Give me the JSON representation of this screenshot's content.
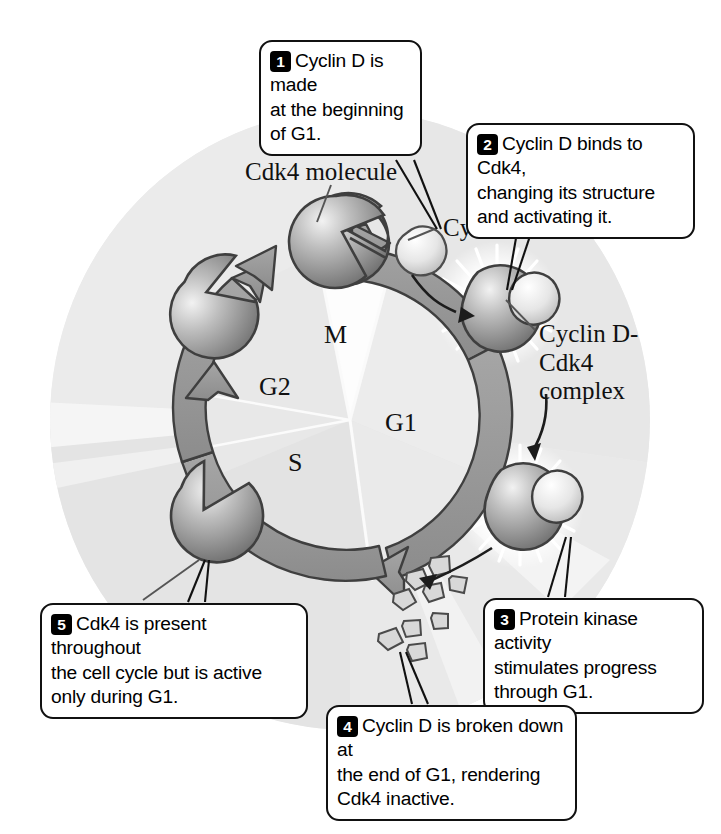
{
  "figure": {
    "title_absent": true,
    "background_color": "#ffffff",
    "cell_fill": "#eeeeee",
    "ring_fill": "#9a9a9a",
    "ring_stroke": "#3c3c3c",
    "protein_dark": "#8d8d8d",
    "protein_light": "#e2e2e2"
  },
  "callouts": [
    {
      "number": "1",
      "text": "Cyclin D is made\nat the beginning\nof G1."
    },
    {
      "number": "2",
      "text": "Cyclin D binds to Cdk4,\nchanging its structure\nand activating it."
    },
    {
      "number": "3",
      "text": "Protein kinase activity\nstimulates progress\nthrough G1."
    },
    {
      "number": "4",
      "text": "Cyclin D is broken down at\nthe end of G1, rendering\nCdk4 inactive."
    },
    {
      "number": "5",
      "text": "Cdk4 is present throughout\nthe cell cycle but is active\nonly during G1."
    }
  ],
  "labels": {
    "cdk4_molecule": "Cdk4 molecule",
    "cyclin_d": "Cyclin D",
    "complex": "Cyclin D-\nCdk4\ncomplex"
  },
  "cycle_phases": {
    "m": "M",
    "g2": "G2",
    "s": "S",
    "g1": "G1"
  }
}
